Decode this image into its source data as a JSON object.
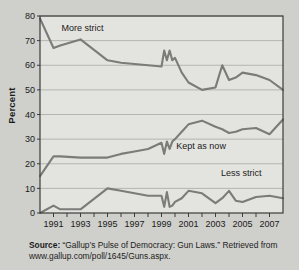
{
  "chart_data": {
    "type": "line",
    "title": "",
    "xlabel": "",
    "ylabel": "Percent",
    "xlim": [
      1990,
      2008
    ],
    "ylim": [
      0,
      80
    ],
    "ytick_step": 10,
    "grid": true,
    "legend": "inline-annotations",
    "yticks": [
      "0",
      "10",
      "20",
      "30",
      "40",
      "50",
      "60",
      "70",
      "80"
    ],
    "xticks": [
      "1991",
      "1993",
      "1995",
      "1997",
      "1999",
      "2001",
      "2003",
      "2005",
      "2007"
    ],
    "line_color": "#7b7b79",
    "series": [
      {
        "name": "More strict",
        "x": [
          1990,
          1991,
          1991.5,
          1993,
          1995,
          1996,
          1997,
          1998,
          1999,
          1999.2,
          1999.4,
          1999.6,
          1999.8,
          2000,
          2000.5,
          2001,
          2002,
          2003,
          2003.5,
          2004,
          2004.5,
          2005,
          2006,
          2007,
          2008
        ],
        "values": [
          79,
          67,
          68,
          70.5,
          62,
          61,
          60.5,
          60,
          59.5,
          66,
          62,
          66,
          62,
          63,
          57,
          53,
          50,
          51,
          60,
          54,
          55,
          57,
          56,
          54,
          50
        ]
      },
      {
        "name": "Kept as now",
        "x": [
          1990,
          1991,
          1991.5,
          1993,
          1995,
          1996,
          1997,
          1998,
          1999,
          1999.2,
          1999.4,
          1999.6,
          1999.8,
          2000,
          2000.5,
          2001,
          2002,
          2003,
          2003.5,
          2004,
          2004.5,
          2005,
          2006,
          2007,
          2008
        ],
        "values": [
          15,
          23,
          23,
          22.5,
          22.5,
          24,
          25,
          26,
          28.5,
          24,
          29,
          26,
          29,
          30,
          33,
          36,
          37.5,
          35,
          34,
          32.5,
          33,
          34,
          34.5,
          32,
          38
        ]
      },
      {
        "name": "Less strict",
        "x": [
          1990,
          1991,
          1991.5,
          1993,
          1995,
          1996,
          1997,
          1998,
          1999,
          1999.2,
          1999.4,
          1999.6,
          1999.8,
          2000,
          2000.5,
          2001,
          2002,
          2003,
          2003.5,
          2004,
          2004.5,
          2005,
          2006,
          2007,
          2008
        ],
        "values": [
          0,
          3,
          1.5,
          1.5,
          10,
          9,
          8,
          7,
          7,
          2.5,
          8.5,
          2.5,
          3,
          4.5,
          6,
          9,
          8,
          4,
          6,
          9,
          5,
          4.5,
          6.5,
          7,
          6
        ]
      }
    ],
    "annotations": [
      {
        "text": "More strict",
        "x": 1991.6,
        "y": 74
      },
      {
        "text": "Kept as now",
        "x": 2000.1,
        "y": 26
      },
      {
        "text": "Less strict",
        "x": 2003.4,
        "y": 15
      }
    ]
  },
  "caption": {
    "source_label": "Source:",
    "source_text": " “Gallup’s Pulse of Democracy: Gun Laws.” Retrieved from www.gallup.com/poll/1645/Guns.aspx."
  }
}
